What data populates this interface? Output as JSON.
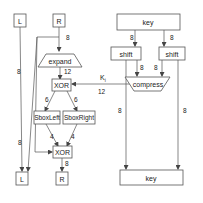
{
  "diagram": {
    "nodes": {
      "L_in": "L",
      "R_in": "R",
      "key_in": "key",
      "expand": "expand",
      "shift_left": "shift",
      "shift_right": "shift",
      "compress": "compress",
      "xor_top": "XOR",
      "sbox_left": "SboxLeft",
      "sbox_right": "SboxRight",
      "xor_bottom": "XOR",
      "L_out": "L",
      "R_out": "R",
      "key_out": "key"
    },
    "edge_labels": {
      "R_to_expand": "8",
      "L_to_xor_bottom": "8",
      "expand_to_xor": "12",
      "key_to_shift_left": "8",
      "key_to_shift_right": "8",
      "shift_left_to_compress": "8",
      "shift_right_to_compress": "8",
      "ki_label": "K",
      "ki_sub": "i",
      "compress_to_xor": "12",
      "xor_to_sbox_left": "6",
      "xor_to_sbox_right": "6",
      "sbox_left_to_xor": "4",
      "sbox_right_to_xor": "4",
      "R_to_L_out": "8",
      "xor_to_R_out": "8",
      "shift_left_to_key_out": "8",
      "shift_right_to_key_out": "8"
    }
  }
}
